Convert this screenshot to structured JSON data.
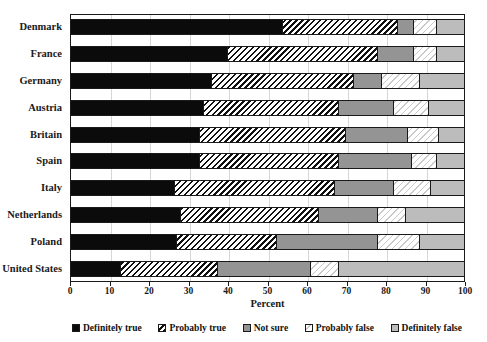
{
  "chart_data": {
    "type": "bar",
    "orientation": "horizontal",
    "stacked": true,
    "stack_mode": "percent",
    "title": "",
    "xlabel": "Percent",
    "ylabel": "",
    "xlim": [
      0,
      100
    ],
    "xticks": [
      0,
      10,
      20,
      30,
      40,
      50,
      60,
      70,
      80,
      90,
      100
    ],
    "xtick_labels": [
      "0",
      "10",
      "20",
      "30",
      "40",
      "50",
      "60",
      "70",
      "80",
      "90",
      "100"
    ],
    "grid": true,
    "grid_axis": "x",
    "legend_position": "bottom",
    "categories": [
      "Denmark",
      "France",
      "Germany",
      "Austria",
      "Britain",
      "Spain",
      "Italy",
      "Netherlands",
      "Poland",
      "United States"
    ],
    "series": [
      {
        "name": "Definitely true",
        "fill": "solid-black",
        "color": "#0b0b0b",
        "values": [
          54,
          40,
          36,
          34,
          33,
          33,
          26.5,
          28,
          27,
          13
        ]
      },
      {
        "name": "Probably true",
        "fill": "dense-diagonal-hatch",
        "color": "#101010",
        "values": [
          29,
          38,
          36,
          34,
          37,
          35,
          40.5,
          35,
          25.5,
          24.5
        ]
      },
      {
        "name": "Not sure",
        "fill": "solid-medium-gray",
        "color": "#949494",
        "values": [
          4,
          9,
          7,
          14,
          15.5,
          18.5,
          15,
          15,
          25.5,
          23.5
        ]
      },
      {
        "name": "Probably false",
        "fill": "light-diagonal-hatch",
        "color": "#c9c9c9",
        "values": [
          6,
          6,
          9.5,
          9,
          8,
          6.5,
          9.5,
          7,
          10.5,
          7
        ]
      },
      {
        "name": "Definitely false",
        "fill": "solid-light-gray",
        "color": "#bcbcbc",
        "values": [
          7,
          7,
          11.5,
          9,
          6.5,
          7,
          8.5,
          15,
          11.5,
          32
        ]
      }
    ]
  },
  "legend": {
    "items": [
      {
        "label": "Definitely true"
      },
      {
        "label": "Probably true"
      },
      {
        "label": "Not sure"
      },
      {
        "label": "Probably false"
      },
      {
        "label": "Definitely false"
      }
    ]
  }
}
